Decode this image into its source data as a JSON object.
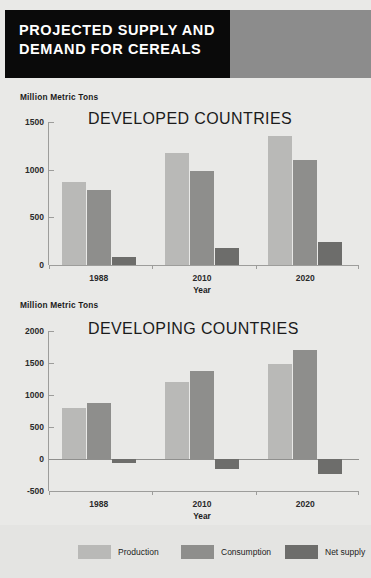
{
  "header": {
    "title_line1": "PROJECTED SUPPLY AND",
    "title_line2": "DEMAND FOR CEREALS",
    "title_bg": "#0a0a0a",
    "accent_color": "#8c8c8c"
  },
  "colors": {
    "background": "#e9e9e7",
    "production": "#b9b9b7",
    "consumption": "#8e8e8c",
    "net_supply": "#6d6d6b",
    "axis": "#9d9d9b"
  },
  "legend": {
    "items": [
      {
        "label": "Production",
        "color": "#b9b9b7"
      },
      {
        "label": "Consumption",
        "color": "#8e8e8c"
      },
      {
        "label": "Net supply",
        "color": "#6d6d6b"
      }
    ]
  },
  "chart_data": [
    {
      "type": "bar",
      "title": "DEVELOPED COUNTRIES",
      "unit_label": "Million Metric Tons",
      "xlabel": "Year",
      "ylabel": "Million Metric Tons",
      "categories": [
        "1988",
        "2010",
        "2020"
      ],
      "ylim": [
        0,
        1500
      ],
      "yticks": [
        0,
        500,
        1000,
        1500
      ],
      "grid": false,
      "legend_position": "bottom",
      "series": [
        {
          "name": "Production",
          "color": "#b9b9b7",
          "values": [
            870,
            1170,
            1350
          ]
        },
        {
          "name": "Consumption",
          "color": "#8e8e8c",
          "values": [
            790,
            990,
            1100
          ]
        },
        {
          "name": "Net supply",
          "color": "#6d6d6b",
          "values": [
            80,
            180,
            240
          ]
        }
      ]
    },
    {
      "type": "bar",
      "title": "DEVELOPING COUNTRIES",
      "unit_label": "Million Metric Tons",
      "xlabel": "Year",
      "ylabel": "Million Metric Tons",
      "categories": [
        "1988",
        "2010",
        "2020"
      ],
      "ylim": [
        -500,
        2000
      ],
      "yticks": [
        -500,
        0,
        500,
        1000,
        1500,
        2000
      ],
      "grid": false,
      "legend_position": "bottom",
      "series": [
        {
          "name": "Production",
          "color": "#b9b9b7",
          "values": [
            790,
            1210,
            1480
          ]
        },
        {
          "name": "Consumption",
          "color": "#8e8e8c",
          "values": [
            880,
            1370,
            1710
          ]
        },
        {
          "name": "Net supply",
          "color": "#6d6d6b",
          "values": [
            -55,
            -160,
            -240
          ]
        }
      ]
    }
  ]
}
